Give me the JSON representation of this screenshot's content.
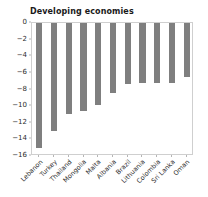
{
  "chart_data": {
    "type": "bar",
    "title": "Developing economies",
    "xlabel": "",
    "ylabel": "",
    "categories": [
      "Lebanon",
      "Turkey",
      "Thailand",
      "Mongolia",
      "Malta",
      "Albania",
      "Brazil",
      "Lithuania",
      "Colombia",
      "Sri Lanka",
      "Oman"
    ],
    "values": [
      -15.0,
      -13.0,
      -11.0,
      -10.6,
      -9.9,
      -8.4,
      -7.3,
      -7.2,
      -7.2,
      -7.2,
      -6.5
    ],
    "ylim": [
      -16,
      0
    ],
    "yticks": [
      0,
      -2,
      -4,
      -6,
      -8,
      -10,
      -12,
      -14,
      -16
    ],
    "ytick_labels": [
      "0",
      "−2",
      "−4",
      "−6",
      "−8",
      "−10",
      "−12",
      "−14",
      "−16"
    ],
    "grid": false,
    "legend": false,
    "bar_color": "#7f7f7f",
    "background_color": "#ffffff",
    "axis_color": "#cfcfcf",
    "text_color": "#2b2b2b"
  }
}
